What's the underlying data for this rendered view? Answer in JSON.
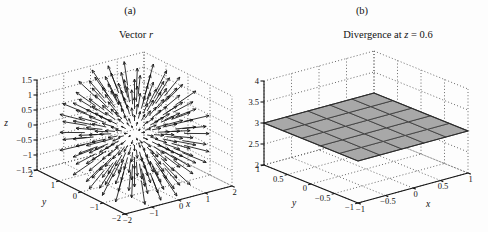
{
  "figure": {
    "background": "#fdfdfd",
    "panels": [
      {
        "tag": "(a)",
        "title_parts": {
          "prefix": "Vector ",
          "italic": "r",
          "suffix": ""
        }
      },
      {
        "tag": "(b)",
        "title_parts": {
          "prefix": "Divergence at ",
          "italic": "z",
          "suffix": " = 0.6"
        }
      }
    ]
  },
  "chart_data": [
    {
      "type": "quiver3d",
      "panel": "(a)",
      "title": "Vector r",
      "xlabel": "x",
      "ylabel": "y",
      "zlabel": "z",
      "xlim": [
        -2,
        2
      ],
      "ylim": [
        -2,
        2
      ],
      "zlim": [
        -1.5,
        1.5
      ],
      "x_ticks": [
        -2,
        -1,
        0,
        1,
        2
      ],
      "y_ticks": [
        -2,
        -1,
        0,
        1,
        2
      ],
      "z_ticks": [
        -1.5,
        -1,
        -0.5,
        0,
        0.5,
        1,
        1.5
      ],
      "field": "F(x,y,z) = (x, y, z); arrows point radially outward from the origin",
      "sample_grid": {
        "min": -1.2,
        "max": 1.2,
        "points": 7,
        "clip_radius": 1.5
      },
      "arrow_scale": 0.5,
      "arrow_color": "#111111",
      "grid": "dotted"
    },
    {
      "type": "surface3d",
      "panel": "(b)",
      "title": "Divergence at z = 0.6",
      "xlabel": "x",
      "ylabel": "y",
      "zlabel": "",
      "xlim": [
        -1,
        1
      ],
      "ylim": [
        -1,
        1
      ],
      "zlim": [
        2,
        4
      ],
      "x_ticks": [
        -1,
        -0.5,
        0,
        0.5,
        1
      ],
      "y_ticks": [
        -1,
        -0.5,
        0,
        0.5,
        1
      ],
      "z_ticks": [
        2,
        2.5,
        3,
        3.5,
        4
      ],
      "surface_value": 3,
      "note": "divergence is constant = 3 over the whole x-y range (flat plane at z = 3)",
      "mesh_divisions": 5,
      "surface_fill": "#a8a8a8",
      "mesh_line_color": "#3f3f3f",
      "grid": "dotted"
    }
  ]
}
